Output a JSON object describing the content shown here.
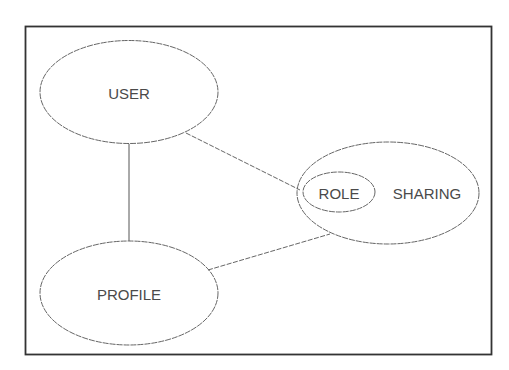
{
  "diagram": {
    "frame": {
      "stroke": "#333333"
    },
    "nodes": {
      "user": {
        "label": "USER"
      },
      "profile": {
        "label": "PROFILE"
      },
      "sharing": {
        "label": "SHARING"
      },
      "role": {
        "label": "ROLE"
      }
    },
    "edges": [
      {
        "from": "USER",
        "to": "PROFILE",
        "style": "solid"
      },
      {
        "from": "USER",
        "to": "ROLE",
        "style": "dashed"
      },
      {
        "from": "PROFILE",
        "to": "SHARING",
        "style": "dashed"
      }
    ]
  }
}
